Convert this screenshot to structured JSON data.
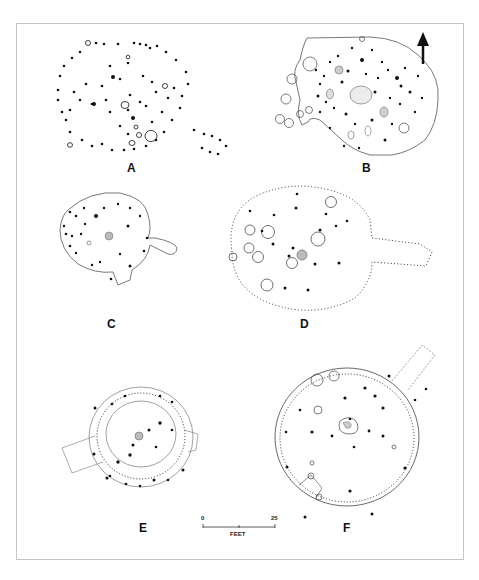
{
  "figure": {
    "plans": [
      {
        "id": "A",
        "label": "A"
      },
      {
        "id": "B",
        "label": "B"
      },
      {
        "id": "C",
        "label": "C"
      },
      {
        "id": "D",
        "label": "D"
      },
      {
        "id": "E",
        "label": "E"
      },
      {
        "id": "F",
        "label": "F"
      }
    ],
    "north_arrow": "north-arrow",
    "scale_bar": {
      "start": "0",
      "end": "25",
      "unit": "FEET"
    }
  }
}
